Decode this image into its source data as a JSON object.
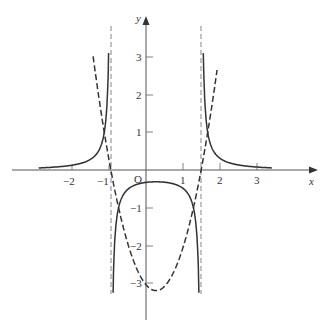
{
  "chart_data": {
    "type": "line",
    "title": "",
    "xlabel": "x",
    "ylabel": "y",
    "origin_label": "O",
    "xlim": [
      -3.6,
      4.5
    ],
    "ylim": [
      -4.0,
      4.5
    ],
    "grid": false,
    "x_ticks": [
      -2,
      -1,
      1,
      2,
      3
    ],
    "x_tick_labels": [
      "−2",
      "−1",
      "1",
      "2",
      "3"
    ],
    "y_ticks": [
      3,
      2,
      1,
      -1,
      -2,
      -3
    ],
    "y_tick_labels": [
      "3",
      "2",
      "1",
      "−1",
      "−2",
      "−3"
    ],
    "series": [
      {
        "name": "g(x) (dashed parabola)",
        "style": "dashed",
        "formula": "2.15*(x-0.27)^2 - 3.2",
        "x_range": [
          -1.43,
          1.92
        ],
        "key_points": [
          [
            -1.13,
            1
          ],
          [
            -0.95,
            0
          ],
          [
            -0.74,
            -1
          ],
          [
            0,
            -3.04
          ],
          [
            0.27,
            -3.2
          ],
          [
            1.28,
            -1
          ],
          [
            1.49,
            0
          ],
          [
            1.67,
            1
          ]
        ]
      },
      {
        "name": "1/g(x) (solid reciprocal)",
        "style": "solid",
        "formula": "1/(2.15*(x-0.27)^2 - 3.2)",
        "asymptotes_x": [
          -0.95,
          1.49
        ],
        "key_points": [
          [
            -2.9,
            0.06
          ],
          [
            -1.13,
            1
          ],
          [
            -0.74,
            -1
          ],
          [
            0.27,
            -0.31
          ],
          [
            1.28,
            -1
          ],
          [
            1.67,
            1
          ],
          [
            3.4,
            0.06
          ]
        ]
      },
      {
        "name": "vertical asymptotes",
        "style": "thin-dashed",
        "x_values": [
          -0.95,
          1.49
        ]
      }
    ]
  },
  "labels": {
    "x_axis": "x",
    "y_axis": "y",
    "origin": "O",
    "xt": [
      "−2",
      "−1",
      "1",
      "2",
      "3"
    ],
    "yt": [
      "3",
      "2",
      "1",
      "−1",
      "−2",
      "−3"
    ]
  }
}
